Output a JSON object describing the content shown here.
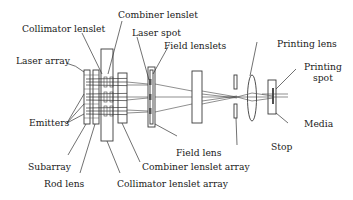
{
  "figure": {
    "labels": {
      "collimator_lenslet": "Collimator lenslet",
      "combiner_lenslet": "Combiner lenslet",
      "laser_spot": "Laser spot",
      "field_lenslets": "Field lenslets",
      "laser_array": "Laser array",
      "printing_lens": "Printing lens",
      "printing_spot_line1": "Printing",
      "printing_spot_line2": "spot",
      "emitters": "Emitters",
      "media": "Media",
      "field_lens": "Field lens",
      "stop": "Stop",
      "subarray": "Subarray",
      "combiner_lenslet_array": "Combiner lenslet array",
      "rod_lens": "Rod lens",
      "collimator_lenslet_array": "Collimator lenslet array"
    }
  }
}
